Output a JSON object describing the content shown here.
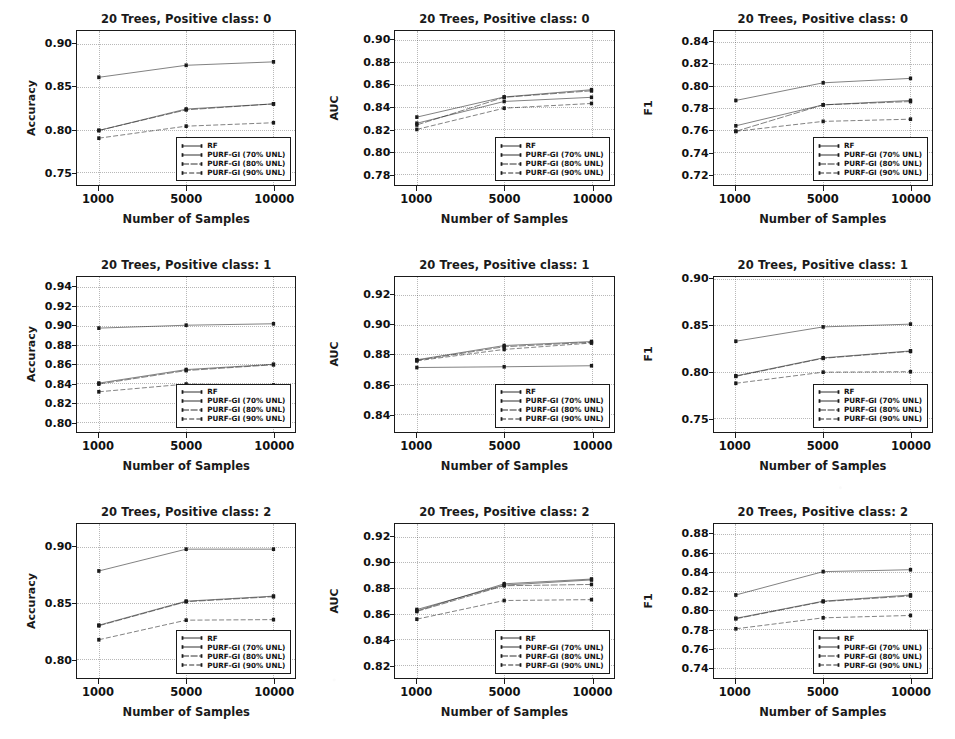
{
  "figure": {
    "xlabel": "Number of Samples",
    "x_categories": [
      "1000",
      "5000",
      "10000"
    ],
    "legend_entries": [
      "RF",
      "PURF-GI (70% UNL)",
      "PURF-GI (80% UNL)",
      "PURF-GI (90% UNL)"
    ],
    "series_color": "#1a1a1a"
  },
  "chart_data": [
    {
      "type": "line",
      "title": "20 Trees, Positive class: 0",
      "xlabel": "Number of Samples",
      "ylabel": "Accuracy",
      "x": [
        1000,
        5000,
        10000
      ],
      "xtick_labels": [
        "1000",
        "5000",
        "10000"
      ],
      "ytick_labels": [
        "0.75",
        "0.80",
        "0.85",
        "0.90"
      ],
      "yticks": [
        0.75,
        0.8,
        0.85,
        0.9
      ],
      "ylim": [
        0.735,
        0.915
      ],
      "grid": true,
      "legend_position": "lower right",
      "series": [
        {
          "name": "RF",
          "values": [
            0.861,
            0.875,
            0.879
          ]
        },
        {
          "name": "PURF-GI (70% UNL)",
          "values": [
            0.799,
            0.824,
            0.83
          ]
        },
        {
          "name": "PURF-GI (80% UNL)",
          "values": [
            0.799,
            0.823,
            0.83
          ]
        },
        {
          "name": "PURF-GI (90% UNL)",
          "values": [
            0.79,
            0.804,
            0.808
          ]
        }
      ]
    },
    {
      "type": "line",
      "title": "20 Trees, Positive class: 0",
      "xlabel": "Number of Samples",
      "ylabel": "AUC",
      "x": [
        1000,
        5000,
        10000
      ],
      "xtick_labels": [
        "1000",
        "5000",
        "10000"
      ],
      "ytick_labels": [
        "0.78",
        "0.80",
        "0.82",
        "0.84",
        "0.86",
        "0.88",
        "0.90"
      ],
      "yticks": [
        0.78,
        0.8,
        0.82,
        0.84,
        0.86,
        0.88,
        0.9
      ],
      "ylim": [
        0.77,
        0.908
      ],
      "grid": true,
      "legend_position": "lower right",
      "series": [
        {
          "name": "RF",
          "values": [
            0.8255,
            0.845,
            0.8487
          ]
        },
        {
          "name": "PURF-GI (70% UNL)",
          "values": [
            0.831,
            0.849,
            0.8555
          ]
        },
        {
          "name": "PURF-GI (80% UNL)",
          "values": [
            0.824,
            0.8487,
            0.8545
          ]
        },
        {
          "name": "PURF-GI (90% UNL)",
          "values": [
            0.82,
            0.839,
            0.8432
          ]
        }
      ]
    },
    {
      "type": "line",
      "title": "20 Trees, Positive class: 0",
      "xlabel": "Number of Samples",
      "ylabel": "F1",
      "x": [
        1000,
        5000,
        10000
      ],
      "xtick_labels": [
        "1000",
        "5000",
        "10000"
      ],
      "ytick_labels": [
        "0.72",
        "0.74",
        "0.76",
        "0.78",
        "0.80",
        "0.82",
        "0.84"
      ],
      "yticks": [
        0.72,
        0.74,
        0.76,
        0.78,
        0.8,
        0.82,
        0.84
      ],
      "ylim": [
        0.71,
        0.85
      ],
      "grid": true,
      "legend_position": "lower right",
      "series": [
        {
          "name": "RF",
          "values": [
            0.787,
            0.803,
            0.807
          ]
        },
        {
          "name": "PURF-GI (70% UNL)",
          "values": [
            0.764,
            0.783,
            0.787
          ]
        },
        {
          "name": "PURF-GI (80% UNL)",
          "values": [
            0.759,
            0.783,
            0.786
          ]
        },
        {
          "name": "PURF-GI (90% UNL)",
          "values": [
            0.759,
            0.768,
            0.77
          ]
        }
      ]
    },
    {
      "type": "line",
      "title": "20 Trees, Positive class: 1",
      "xlabel": "Number of Samples",
      "ylabel": "Accuracy",
      "x": [
        1000,
        5000,
        10000
      ],
      "xtick_labels": [
        "1000",
        "5000",
        "10000"
      ],
      "ytick_labels": [
        "0.80",
        "0.82",
        "0.84",
        "0.86",
        "0.88",
        "0.90",
        "0.92",
        "0.94"
      ],
      "yticks": [
        0.8,
        0.82,
        0.84,
        0.86,
        0.88,
        0.9,
        0.92,
        0.94
      ],
      "ylim": [
        0.79,
        0.95
      ],
      "grid": true,
      "legend_position": "lower right",
      "series": [
        {
          "name": "RF",
          "values": [
            0.897,
            0.9,
            0.9015
          ]
        },
        {
          "name": "PURF-GI (70% UNL)",
          "values": [
            0.84,
            0.854,
            0.8595
          ]
        },
        {
          "name": "PURF-GI (80% UNL)",
          "values": [
            0.839,
            0.853,
            0.859
          ]
        },
        {
          "name": "PURF-GI (90% UNL)",
          "values": [
            0.831,
            0.839,
            0.838
          ]
        }
      ]
    },
    {
      "type": "line",
      "title": "20 Trees, Positive class: 1",
      "xlabel": "Number of Samples",
      "ylabel": "AUC",
      "x": [
        1000,
        5000,
        10000
      ],
      "xtick_labels": [
        "1000",
        "5000",
        "10000"
      ],
      "ytick_labels": [
        "0.84",
        "0.86",
        "0.88",
        "0.90",
        "0.92"
      ],
      "yticks": [
        0.84,
        0.86,
        0.88,
        0.9,
        0.92
      ],
      "ylim": [
        0.828,
        0.932
      ],
      "grid": true,
      "legend_position": "lower right",
      "series": [
        {
          "name": "RF",
          "values": [
            0.871,
            0.8715,
            0.8722
          ]
        },
        {
          "name": "PURF-GI (70% UNL)",
          "values": [
            0.8762,
            0.8858,
            0.8885
          ]
        },
        {
          "name": "PURF-GI (80% UNL)",
          "values": [
            0.8758,
            0.885,
            0.888
          ]
        },
        {
          "name": "PURF-GI (90% UNL)",
          "values": [
            0.8755,
            0.8832,
            0.8875
          ]
        }
      ]
    },
    {
      "type": "line",
      "title": "20 Trees, Positive class: 1",
      "xlabel": "Number of Samples",
      "ylabel": "F1",
      "x": [
        1000,
        5000,
        10000
      ],
      "xtick_labels": [
        "1000",
        "5000",
        "10000"
      ],
      "ytick_labels": [
        "0.75",
        "0.80",
        "0.85",
        "0.90"
      ],
      "yticks": [
        0.75,
        0.8,
        0.85,
        0.9
      ],
      "ylim": [
        0.735,
        0.902
      ],
      "grid": true,
      "legend_position": "lower right",
      "series": [
        {
          "name": "RF",
          "values": [
            0.8325,
            0.848,
            0.851
          ]
        },
        {
          "name": "PURF-GI (70% UNL)",
          "values": [
            0.795,
            0.8145,
            0.822
          ]
        },
        {
          "name": "PURF-GI (80% UNL)",
          "values": [
            0.7945,
            0.814,
            0.8215
          ]
        },
        {
          "name": "PURF-GI (90% UNL)",
          "values": [
            0.787,
            0.799,
            0.7995
          ]
        }
      ]
    },
    {
      "type": "line",
      "title": "20 Trees, Positive class: 2",
      "xlabel": "Number of Samples",
      "ylabel": "Accuracy",
      "x": [
        1000,
        5000,
        10000
      ],
      "xtick_labels": [
        "1000",
        "5000",
        "10000"
      ],
      "ytick_labels": [
        "0.80",
        "0.85",
        "0.90"
      ],
      "yticks": [
        0.8,
        0.85,
        0.9
      ],
      "ylim": [
        0.783,
        0.921
      ],
      "grid": true,
      "legend_position": "lower right",
      "series": [
        {
          "name": "RF",
          "values": [
            0.879,
            0.8985,
            0.8985
          ]
        },
        {
          "name": "PURF-GI (70% UNL)",
          "values": [
            0.8305,
            0.852,
            0.8565
          ]
        },
        {
          "name": "PURF-GI (80% UNL)",
          "values": [
            0.83,
            0.8515,
            0.856
          ]
        },
        {
          "name": "PURF-GI (90% UNL)",
          "values": [
            0.8175,
            0.835,
            0.8355
          ]
        }
      ]
    },
    {
      "type": "line",
      "title": "20 Trees, Positive class: 2",
      "xlabel": "Number of Samples",
      "ylabel": "AUC",
      "x": [
        1000,
        5000,
        10000
      ],
      "xtick_labels": [
        "1000",
        "5000",
        "10000"
      ],
      "ytick_labels": [
        "0.82",
        "0.84",
        "0.86",
        "0.88",
        "0.90",
        "0.92"
      ],
      "yticks": [
        0.82,
        0.84,
        0.86,
        0.88,
        0.9,
        0.92
      ],
      "ylim": [
        0.81,
        0.93
      ],
      "grid": true,
      "legend_position": "lower right",
      "series": [
        {
          "name": "RF",
          "values": [
            0.8635,
            0.8825,
            0.8865
          ]
        },
        {
          "name": "PURF-GI (70% UNL)",
          "values": [
            0.8625,
            0.8835,
            0.8872
          ]
        },
        {
          "name": "PURF-GI (80% UNL)",
          "values": [
            0.862,
            0.882,
            0.883
          ]
        },
        {
          "name": "PURF-GI (90% UNL)",
          "values": [
            0.856,
            0.8705,
            0.8712
          ]
        }
      ]
    },
    {
      "type": "line",
      "title": "20 Trees, Positive class: 2",
      "xlabel": "Number of Samples",
      "ylabel": "F1",
      "x": [
        1000,
        5000,
        10000
      ],
      "xtick_labels": [
        "1000",
        "5000",
        "10000"
      ],
      "ytick_labels": [
        "0.74",
        "0.76",
        "0.78",
        "0.80",
        "0.82",
        "0.84",
        "0.86",
        "0.88"
      ],
      "yticks": [
        0.74,
        0.76,
        0.78,
        0.8,
        0.82,
        0.84,
        0.86,
        0.88
      ],
      "ylim": [
        0.729,
        0.891
      ],
      "grid": true,
      "legend_position": "lower right",
      "series": [
        {
          "name": "RF",
          "values": [
            0.8165,
            0.841,
            0.843
          ]
        },
        {
          "name": "PURF-GI (70% UNL)",
          "values": [
            0.792,
            0.81,
            0.8165
          ]
        },
        {
          "name": "PURF-GI (80% UNL)",
          "values": [
            0.7915,
            0.8095,
            0.8155
          ]
        },
        {
          "name": "PURF-GI (90% UNL)",
          "values": [
            0.781,
            0.7925,
            0.795
          ]
        }
      ]
    }
  ]
}
